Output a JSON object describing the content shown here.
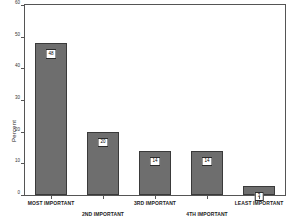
{
  "chart_data": {
    "type": "bar",
    "title": "",
    "xlabel": "",
    "ylabel": "Percent",
    "categories": [
      "MOST IMPORTANT",
      "2ND IMPORTANT",
      "3RD IMPORTANT",
      "4TH IMPORTANT",
      "LEAST IMPORTANT"
    ],
    "values": [
      48,
      20,
      14,
      14,
      3
    ],
    "ylim": [
      0,
      60
    ],
    "yticks": [
      0,
      10,
      20,
      30,
      40,
      50,
      60
    ],
    "ytick_labels": [
      "0",
      "10",
      "20",
      "30",
      "40",
      "50",
      "60"
    ],
    "grid": false,
    "legend": "none",
    "bar_color": "#6e6e6e",
    "bar_edge_color": "#3a3a3a",
    "label_box_color": "#ffffff",
    "axis_color": "#555555"
  },
  "bars": [
    {
      "category": "MOST IMPORTANT",
      "value": 48,
      "label": "48",
      "label_row": 1
    },
    {
      "category": "2ND IMPORTANT",
      "value": 20,
      "label": "20",
      "label_row": 2
    },
    {
      "category": "3RD IMPORTANT",
      "value": 14,
      "label": "14",
      "label_row": 1
    },
    {
      "category": "4TH IMPORTANT",
      "value": 14,
      "label": "14",
      "label_row": 2
    },
    {
      "category": "LEAST IMPORTANT",
      "value": 3,
      "label": "3",
      "label_row": 1
    }
  ]
}
